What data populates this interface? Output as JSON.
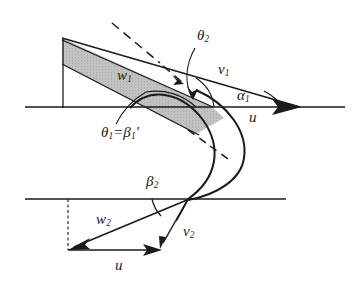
{
  "figure": {
    "kind": "engineering-diagram",
    "background_color": "#ffffff",
    "line_color": "#1a1a1a",
    "shade_color": "#b9b9b9"
  },
  "labels": {
    "theta2": {
      "base": "θ",
      "sub": "2"
    },
    "v1": {
      "base": "v",
      "sub": "1"
    },
    "alpha1": {
      "base": "α",
      "sub": "1"
    },
    "u_top": {
      "base": "u",
      "sub": ""
    },
    "w1": {
      "base": "w",
      "sub": "1"
    },
    "theta1_eq_beta1prime": {
      "base": "θ",
      "sub": "1",
      "rel": "=",
      "base2": "β",
      "sub2": "1",
      "prime": "′"
    },
    "beta2": {
      "base": "β",
      "sub": "2"
    },
    "w2": {
      "base": "w",
      "sub": "2"
    },
    "v2": {
      "base": "v",
      "sub": "2"
    },
    "u_bottom": {
      "base": "u",
      "sub": ""
    }
  },
  "geometry": {
    "axis_top": {
      "y": 107,
      "x_start": 25,
      "x_end": 345
    },
    "axis_bottom": {
      "y": 199,
      "x_start": 25,
      "x_end": 286
    },
    "band_top_left": {
      "x": 62,
      "y": 38
    },
    "band_apex": {
      "x": 205,
      "y": 107
    },
    "arrow_tip_top": {
      "x": 300,
      "y": 107
    },
    "triangle_corner_bottom": {
      "x": 68,
      "y": 250
    },
    "triangle_vertex_bottom": {
      "x": 187,
      "y": 199
    },
    "v2_tip": {
      "x": 160,
      "y": 247
    }
  }
}
